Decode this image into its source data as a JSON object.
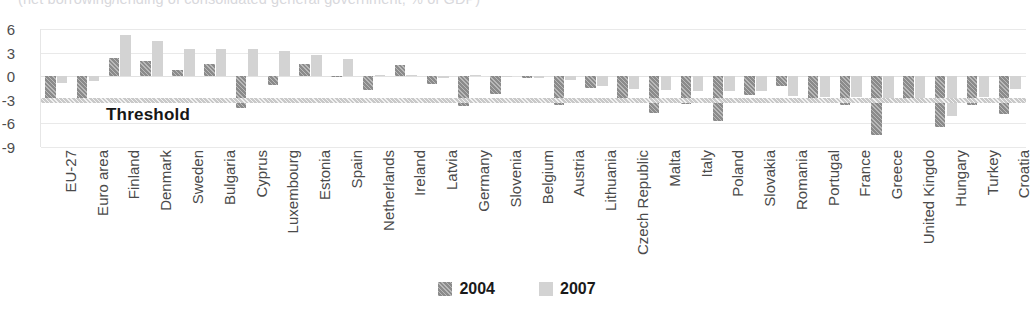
{
  "chart_data": {
    "type": "bar",
    "title": "(net borrowing/lending of consolidated general government, % of GDP)",
    "xlabel": "",
    "ylabel": "",
    "ylim": [
      -9,
      6
    ],
    "yticks": [
      6,
      3,
      0,
      -3,
      -6,
      -9
    ],
    "grid": true,
    "legend_position": "bottom",
    "categories": [
      "EU-27",
      "Euro area",
      "Finland",
      "Denmark",
      "Sweden",
      "Bulgaria",
      "Cyprus",
      "Luxembourg",
      "Estonia",
      "Spain",
      "Netherlands",
      "Ireland",
      "Latvia",
      "Germany",
      "Slovenia",
      "Belgium",
      "Austria",
      "Lithuania",
      "Czech Republic",
      "Malta",
      "Italy",
      "Poland",
      "Slovakia",
      "Romania",
      "Portugal",
      "France",
      "Greece",
      "United Kingdo",
      "Hungary",
      "Turkey",
      "Croatia"
    ],
    "series": [
      {
        "name": "2004",
        "values": [
          -2.9,
          -3.0,
          2.3,
          1.9,
          0.8,
          1.6,
          -4.1,
          -1.1,
          1.6,
          -0.1,
          -1.7,
          1.4,
          -1.0,
          -3.8,
          -2.3,
          -0.2,
          -3.7,
          -1.5,
          -3.0,
          -4.7,
          -3.5,
          -5.7,
          -2.4,
          -1.2,
          -3.4,
          -3.6,
          -7.5,
          -3.4,
          -6.4,
          -3.6,
          -4.8
        ]
      },
      {
        "name": "2007",
        "values": [
          -0.9,
          -0.6,
          5.3,
          4.5,
          3.5,
          3.4,
          3.4,
          3.2,
          2.7,
          2.2,
          0.2,
          0.2,
          -0.2,
          0.2,
          0.0,
          -0.2,
          -0.5,
          -1.2,
          -1.6,
          -1.8,
          -1.9,
          -1.9,
          -1.9,
          -2.5,
          -2.6,
          -2.7,
          -2.8,
          -2.8,
          -5.0,
          -2.6,
          -1.6
        ]
      }
    ],
    "annotations": [
      {
        "name": "threshold",
        "label": "Threshold",
        "value": -3
      }
    ]
  },
  "legend": {
    "items": [
      {
        "label": "2004",
        "color": "#8b8b8b"
      },
      {
        "label": "2007",
        "color": "#d3d3d3"
      }
    ]
  }
}
